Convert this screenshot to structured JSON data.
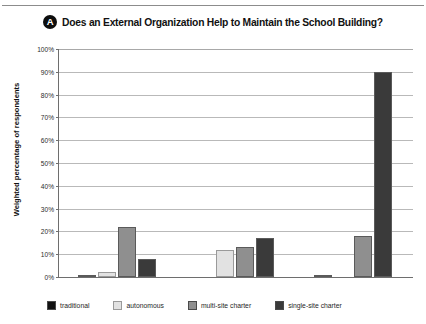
{
  "panel": {
    "badge_letter": "A",
    "title": "Does an External Organization Help to Maintain the School Building?"
  },
  "axes": {
    "y_title": "Weighted percentage of respondents",
    "y_ticks": [
      "0%",
      "10%",
      "20%",
      "30%",
      "40%",
      "50%",
      "60%",
      "70%",
      "80%",
      "90%",
      "100%"
    ]
  },
  "legend": {
    "items": [
      {
        "label": "traditional",
        "color": "#121212"
      },
      {
        "label": "autonomous",
        "color": "#e2e2e2"
      },
      {
        "label": "multi-site charter",
        "color": "#8f8f8f"
      },
      {
        "label": "single-site charter",
        "color": "#3a3a3a"
      }
    ]
  },
  "chart_data": {
    "type": "bar",
    "title": "Does an External Organization Help to Maintain the School Building?",
    "xlabel": "",
    "ylabel": "Weighted percentage of respondents",
    "ylim": [
      0,
      100
    ],
    "ytick_step": 10,
    "grid": true,
    "legend_position": "bottom",
    "categories": [
      "Los Angeles",
      "Denver",
      "New Orleans"
    ],
    "series": [
      {
        "name": "traditional",
        "color": "#121212",
        "values": [
          1,
          0,
          1
        ]
      },
      {
        "name": "autonomous",
        "color": "#e2e2e2",
        "values": [
          2,
          12,
          0
        ]
      },
      {
        "name": "multi-site charter",
        "color": "#8f8f8f",
        "values": [
          22,
          13,
          18
        ]
      },
      {
        "name": "single-site charter",
        "color": "#3a3a3a",
        "values": [
          8,
          17,
          90
        ]
      }
    ]
  }
}
